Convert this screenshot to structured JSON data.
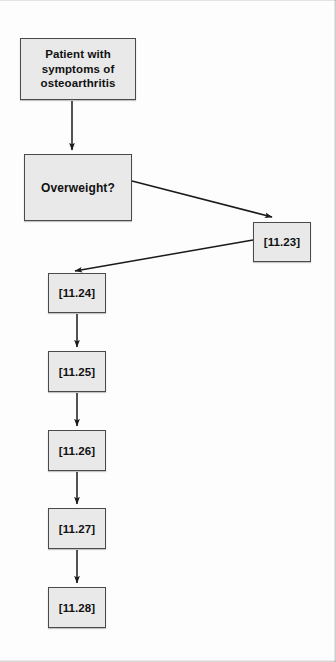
{
  "diagram": {
    "type": "flowchart",
    "orientation": "top-to-bottom",
    "colors": {
      "node_fill": "#e9e9e9",
      "node_border": "#4a4a4a",
      "text": "#111111",
      "edge": "#1a1a1a",
      "page_background": "#fdfdfd"
    },
    "nodes": [
      {
        "id": "n1",
        "label": "Patient with\nsymptoms of\nosteoarthritis",
        "shape": "rectangle",
        "x": 20,
        "y": 38,
        "width": 116,
        "height": 62
      },
      {
        "id": "n2",
        "label": "Overweight?",
        "shape": "rectangle",
        "x": 24,
        "y": 154,
        "width": 108,
        "height": 67
      },
      {
        "id": "n3",
        "label": "[11.23]",
        "shape": "rectangle",
        "x": 253,
        "y": 222,
        "width": 58,
        "height": 40
      },
      {
        "id": "n4",
        "label": "[11.24]",
        "shape": "rectangle",
        "x": 48,
        "y": 273,
        "width": 58,
        "height": 40
      },
      {
        "id": "n5",
        "label": "[11.25]",
        "shape": "rectangle",
        "x": 48,
        "y": 351,
        "width": 58,
        "height": 41
      },
      {
        "id": "n6",
        "label": "[11.26]",
        "shape": "rectangle",
        "x": 48,
        "y": 430,
        "width": 58,
        "height": 41
      },
      {
        "id": "n7",
        "label": "[11.27]",
        "shape": "rectangle",
        "x": 48,
        "y": 508,
        "width": 58,
        "height": 41
      },
      {
        "id": "n8",
        "label": "[11.28]",
        "shape": "rectangle",
        "x": 48,
        "y": 587,
        "width": 58,
        "height": 41
      }
    ],
    "edges": [
      {
        "id": "e1",
        "from": "n1",
        "to": "n2",
        "kind": "vertical-arrow",
        "label": ""
      },
      {
        "id": "e2",
        "from": "n2",
        "to": "n3",
        "kind": "diagonal-arrow-down-right",
        "label": ""
      },
      {
        "id": "e3",
        "from": "n3",
        "to": "n4",
        "kind": "diagonal-arrow-down-left",
        "label": ""
      },
      {
        "id": "e4",
        "from": "n4",
        "to": "n5",
        "kind": "vertical-arrow",
        "label": ""
      },
      {
        "id": "e5",
        "from": "n5",
        "to": "n6",
        "kind": "vertical-arrow",
        "label": ""
      },
      {
        "id": "e6",
        "from": "n6",
        "to": "n7",
        "kind": "vertical-arrow",
        "label": ""
      },
      {
        "id": "e7",
        "from": "n7",
        "to": "n8",
        "kind": "vertical-arrow",
        "label": ""
      }
    ]
  }
}
